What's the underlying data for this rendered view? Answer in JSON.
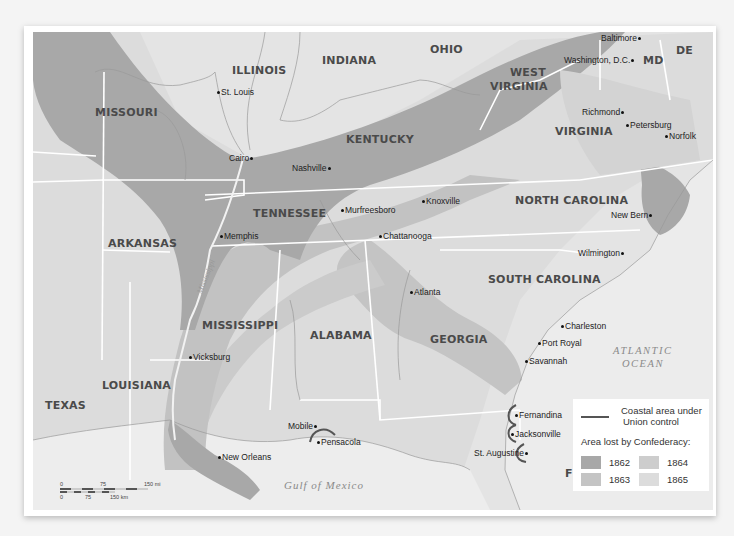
{
  "map": {
    "title": "Area lost by the Confederacy, 1862-1865",
    "colors": {
      "1862": "#a8a8a8",
      "1863": "#c2c2c2",
      "1864": "#cfcfcf",
      "1865": "#dadada",
      "unshaded": "#e4e4e4",
      "water": "#eeeeee",
      "union_coast": "#555555",
      "border": "#ffffff"
    },
    "states": [
      {
        "name": "MISSOURI",
        "x": 95,
        "y": 107
      },
      {
        "name": "ILLINOIS",
        "x": 232,
        "y": 65
      },
      {
        "name": "INDIANA",
        "x": 322,
        "y": 55
      },
      {
        "name": "OHIO",
        "x": 430,
        "y": 44
      },
      {
        "name": "WEST",
        "x": 497,
        "y": 68
      },
      {
        "name": "VIRGINIA",
        "x": 490,
        "y": 82
      },
      {
        "name": "KENTUCKY",
        "x": 346,
        "y": 135
      },
      {
        "name": "VIRGINIA",
        "x": 555,
        "y": 127
      },
      {
        "name": "MD",
        "x": 643,
        "y": 55
      },
      {
        "name": "DE",
        "x": 676,
        "y": 45
      },
      {
        "name": "NORTH CAROLINA",
        "x": 515,
        "y": 195
      },
      {
        "name": "TENNESSEE",
        "x": 254,
        "y": 208
      },
      {
        "name": "ARKANSAS",
        "x": 108,
        "y": 238
      },
      {
        "name": "SOUTH CAROLINA",
        "x": 488,
        "y": 274
      },
      {
        "name": "MISSISSIPPI",
        "x": 200,
        "y": 326
      },
      {
        "name": "ALABAMA",
        "x": 310,
        "y": 330
      },
      {
        "name": "GEORGIA",
        "x": 430,
        "y": 335
      },
      {
        "name": "LOUISIANA",
        "x": 102,
        "y": 380
      },
      {
        "name": "TEXAS",
        "x": 45,
        "y": 400
      },
      {
        "name": "FLORIDA",
        "x": 565,
        "y": 468
      }
    ],
    "cities": [
      {
        "name": "St. Louis",
        "x": 216,
        "y": 91,
        "dot": "left"
      },
      {
        "name": "Cairo",
        "x": 229,
        "y": 157,
        "dot": "right"
      },
      {
        "name": "Nashville",
        "x": 290,
        "y": 167,
        "dot": "right"
      },
      {
        "name": "Murfreesboro",
        "x": 340,
        "y": 208,
        "dot": "left"
      },
      {
        "name": "Knoxville",
        "x": 422,
        "y": 199,
        "dot": "left"
      },
      {
        "name": "Memphis",
        "x": 220,
        "y": 235,
        "dot": "left"
      },
      {
        "name": "Chattanooga",
        "x": 378,
        "y": 235,
        "dot": "left"
      },
      {
        "name": "Atlanta",
        "x": 410,
        "y": 291,
        "dot": "left"
      },
      {
        "name": "Vicksburg",
        "x": 189,
        "y": 355,
        "dot": "left"
      },
      {
        "name": "Mobile",
        "x": 287,
        "y": 424,
        "dot": "right"
      },
      {
        "name": "Pensacola",
        "x": 317,
        "y": 439,
        "dot": "left"
      },
      {
        "name": "New Orleans",
        "x": 218,
        "y": 455,
        "dot": "left"
      },
      {
        "name": "Baltimore",
        "x": 601,
        "y": 36,
        "dot": "right"
      },
      {
        "name": "Washington, D.C.",
        "x": 563,
        "y": 58,
        "dot": "right"
      },
      {
        "name": "Richmond",
        "x": 582,
        "y": 110,
        "dot": "right"
      },
      {
        "name": "Petersburg",
        "x": 626,
        "y": 124,
        "dot": "left"
      },
      {
        "name": "Norfolk",
        "x": 664,
        "y": 134,
        "dot": "left"
      },
      {
        "name": "New Bern",
        "x": 610,
        "y": 213,
        "dot": "right"
      },
      {
        "name": "Wilmington",
        "x": 578,
        "y": 251,
        "dot": "right"
      },
      {
        "name": "Charleston",
        "x": 561,
        "y": 324,
        "dot": "left"
      },
      {
        "name": "Port Royal",
        "x": 538,
        "y": 341,
        "dot": "left"
      },
      {
        "name": "Savannah",
        "x": 525,
        "y": 360,
        "dot": "left"
      },
      {
        "name": "Fernandina",
        "x": 514,
        "y": 413,
        "dot": "left"
      },
      {
        "name": "Jacksonville",
        "x": 511,
        "y": 432,
        "dot": "left"
      },
      {
        "name": "St. Augustine",
        "x": 474,
        "y": 451,
        "dot": "right"
      }
    ],
    "water": [
      {
        "name": "ATLANTIC",
        "x": 613,
        "y": 347
      },
      {
        "name": "OCEAN",
        "x": 621,
        "y": 360
      },
      {
        "name": "Gulf of Mexico",
        "x": 284,
        "y": 480
      }
    ],
    "rivers": [
      {
        "name": "Mississippi",
        "x": 193,
        "y": 272
      }
    ]
  },
  "legend": {
    "union_control_label_line1": "Coastal area under",
    "union_control_label_line2": "Union control",
    "header": "Area lost by Confederacy:",
    "items": [
      {
        "year": "1862",
        "color": "#a8a8a8"
      },
      {
        "year": "1863",
        "color": "#c4c4c4"
      },
      {
        "year": "1864",
        "color": "#cdcdcd"
      },
      {
        "year": "1865",
        "color": "#dcdcdc"
      }
    ]
  },
  "scale": {
    "mi_ticks": [
      "0",
      "75",
      "150 mi"
    ],
    "km_ticks": [
      "0",
      "75",
      "150 km"
    ]
  }
}
